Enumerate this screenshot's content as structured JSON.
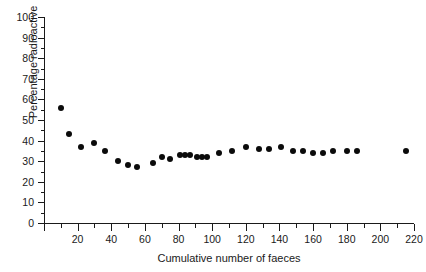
{
  "chart_data": {
    "type": "scatter",
    "title": "",
    "xlabel": "Cumulative number of faeces",
    "ylabel": "Percentage radioactive",
    "xlim": [
      0,
      220
    ],
    "ylim": [
      0,
      100
    ],
    "xticks": [
      0,
      20,
      40,
      60,
      80,
      100,
      120,
      140,
      160,
      180,
      200,
      220
    ],
    "xtick_labels": [
      "",
      "20",
      "40",
      "60",
      "80",
      "100",
      "120",
      "140",
      "160",
      "180",
      "200",
      "220"
    ],
    "xminor_step": 10,
    "yticks": [
      0,
      10,
      20,
      30,
      40,
      50,
      60,
      70,
      80,
      90,
      100
    ],
    "ytick_labels": [
      "0",
      "10",
      "20",
      "30",
      "40",
      "50",
      "60",
      "70",
      "80",
      "90",
      "100"
    ],
    "yminor_step": 5,
    "grid": false,
    "legend": null,
    "marker": "filled-circle",
    "marker_color": "#0b0b0b",
    "marker_size": 6,
    "points": [
      {
        "x": 10,
        "y": 56
      },
      {
        "x": 15,
        "y": 43
      },
      {
        "x": 22,
        "y": 37
      },
      {
        "x": 30,
        "y": 39
      },
      {
        "x": 36,
        "y": 35
      },
      {
        "x": 44,
        "y": 30
      },
      {
        "x": 50,
        "y": 28
      },
      {
        "x": 55,
        "y": 27
      },
      {
        "x": 65,
        "y": 29
      },
      {
        "x": 70,
        "y": 32
      },
      {
        "x": 75,
        "y": 31
      },
      {
        "x": 81,
        "y": 33
      },
      {
        "x": 84,
        "y": 33
      },
      {
        "x": 87,
        "y": 33
      },
      {
        "x": 91,
        "y": 32
      },
      {
        "x": 94,
        "y": 32
      },
      {
        "x": 97,
        "y": 32
      },
      {
        "x": 104,
        "y": 34
      },
      {
        "x": 112,
        "y": 35
      },
      {
        "x": 120,
        "y": 37
      },
      {
        "x": 128,
        "y": 36
      },
      {
        "x": 134,
        "y": 36
      },
      {
        "x": 141,
        "y": 37
      },
      {
        "x": 148,
        "y": 35
      },
      {
        "x": 154,
        "y": 35
      },
      {
        "x": 160,
        "y": 34
      },
      {
        "x": 166,
        "y": 34
      },
      {
        "x": 172,
        "y": 35
      },
      {
        "x": 180,
        "y": 35
      },
      {
        "x": 186,
        "y": 35
      },
      {
        "x": 215,
        "y": 35
      }
    ]
  }
}
